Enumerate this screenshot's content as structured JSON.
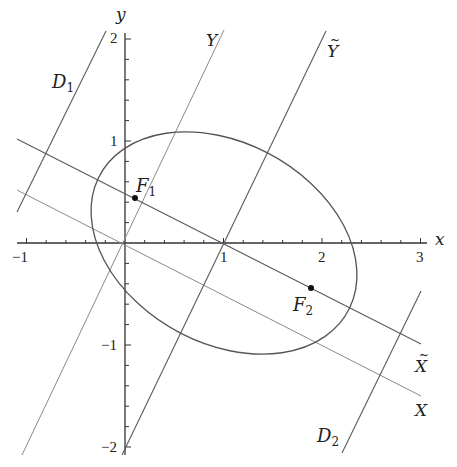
{
  "figure": {
    "axes": {
      "x_label": "x",
      "y_label": "y",
      "x_ticks": [
        {
          "value": -1,
          "label": "−1"
        },
        {
          "value": 1,
          "label": "1"
        },
        {
          "value": 2,
          "label": "2"
        },
        {
          "value": 3,
          "label": "3"
        }
      ],
      "y_ticks": [
        {
          "value": 2,
          "label": "2"
        },
        {
          "value": 1,
          "label": "1"
        },
        {
          "value": -1,
          "label": "−1"
        },
        {
          "value": -2,
          "label": "−2"
        }
      ],
      "x_range": [
        -1.1,
        3.05
      ],
      "y_range": [
        -2.1,
        2.05
      ],
      "minor_tick_step": 0.2
    },
    "ellipse": {
      "center": [
        1,
        0
      ],
      "semi_major": 1.426,
      "semi_minor": 0.988,
      "rotation_deg": -26.57
    },
    "foci": [
      {
        "name": "F1",
        "letter": "F",
        "sub": "1",
        "point": [
          0.11,
          0.45
        ]
      },
      {
        "name": "F2",
        "letter": "F",
        "sub": "2",
        "point": [
          1.89,
          -0.45
        ]
      }
    ],
    "lines": {
      "X": {
        "label": "X",
        "equation": "y = -x/2"
      },
      "X_tilde": {
        "label": "X̃",
        "letter": "X",
        "accent": "~",
        "equation": "y = -(x-1)/2"
      },
      "Y": {
        "label": "Y",
        "equation": "y = 2x"
      },
      "Y_tilde": {
        "label": "Ỹ",
        "letter": "Y",
        "accent": "~",
        "equation": "y = 2(x-1)"
      },
      "D1": {
        "letter": "D",
        "sub": "1"
      },
      "D2": {
        "letter": "D",
        "sub": "2"
      }
    },
    "colors": {
      "axis": "#333333",
      "ellipse": "#555555",
      "primary_lines": "#555555",
      "secondary_lines": "#888888",
      "point": "#111111"
    }
  }
}
